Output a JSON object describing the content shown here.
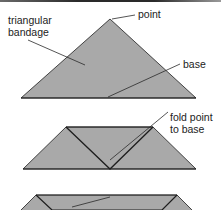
{
  "diagram": {
    "colors": {
      "fill": "#a9a9a9",
      "stroke": "#1e1e1e",
      "leader": "#2a2a2a",
      "text": "#222222",
      "background": "#ffffff"
    },
    "steps": [
      {
        "id": "step-1",
        "shape": "triangle",
        "labels": [
          {
            "id": "triangular-bandage",
            "text": "triangular\nbandage"
          },
          {
            "id": "point",
            "text": "point"
          },
          {
            "id": "base",
            "text": "base"
          }
        ]
      },
      {
        "id": "step-2",
        "shape": "folded-trapezoid",
        "labels": [
          {
            "id": "fold-point-to-base",
            "text": "fold point\nto base"
          }
        ]
      },
      {
        "id": "step-3",
        "shape": "folded-band",
        "labels": []
      }
    ]
  }
}
